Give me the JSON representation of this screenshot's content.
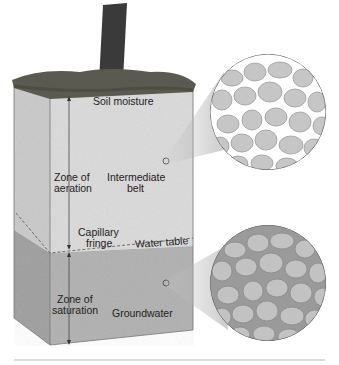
{
  "diagram": {
    "title_hidden": "",
    "labels": {
      "soil_moisture": "Soil moisture",
      "zone_aeration_1": "Zone of",
      "zone_aeration_2": "aeration",
      "intermediate_1": "Intermediate",
      "intermediate_2": "belt",
      "capillary_1": "Capillary",
      "capillary_2": "fringe",
      "water_table": "Water table",
      "zone_saturation_1": "Zone of",
      "zone_saturation_2": "saturation",
      "groundwater": "Groundwater"
    },
    "colors": {
      "upper_soil": "#d6d6d6",
      "lower_soil": "#a9a9a9",
      "grass": "#5a5a50",
      "trunk": "#3a3a3a",
      "grain": "#c8c8c8",
      "pore_air": "#ffffff",
      "pore_water": "#9a9a9a"
    }
  }
}
